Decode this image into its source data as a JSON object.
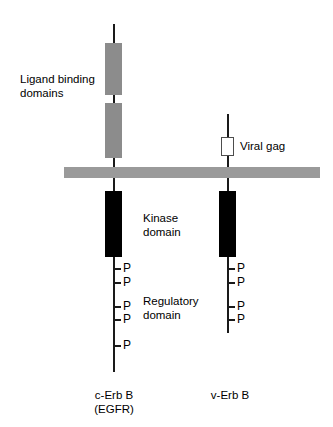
{
  "figure": {
    "type": "diagram",
    "membrane": {
      "name": "plasma-membrane",
      "color": "#9a9a9a"
    },
    "labels": {
      "ligand_binding": "Ligand binding\ndomains",
      "viral_gag": "Viral gag",
      "kinase": "Kinase\ndomain",
      "regulatory": "Regulatory\ndomain"
    },
    "proteins": [
      {
        "id": "c-erb-b",
        "name_line1": "c-Erb B",
        "name_line2": "(EGFR)",
        "axis_x": 114,
        "extracellular_boxes": [
          {
            "label": "ligand-binding-domain-1",
            "color": "#8c8c8c",
            "top": 43,
            "height": 52
          },
          {
            "label": "ligand-binding-domain-2",
            "color": "#8c8c8c",
            "top": 103,
            "height": 55
          }
        ],
        "kinase_box": {
          "label": "kinase-domain",
          "color": "#000000",
          "top": 191,
          "height": 66
        },
        "phosphorylation_sites": [
          {
            "label": "P",
            "y": 262
          },
          {
            "label": "P",
            "y": 276
          },
          {
            "label": "P",
            "y": 300
          },
          {
            "label": "P",
            "y": 313
          },
          {
            "label": "P",
            "y": 339
          }
        ],
        "phosphate_count": 5,
        "tail_end": 372
      },
      {
        "id": "v-erb-b",
        "name_line1": "v-Erb B",
        "name_line2": "",
        "axis_x": 228,
        "extracellular_boxes": [
          {
            "label": "viral-gag-domain",
            "color": "#ffffff",
            "top": 137,
            "height": 19
          }
        ],
        "kinase_box": {
          "label": "kinase-domain",
          "color": "#000000",
          "top": 191,
          "height": 66
        },
        "phosphorylation_sites": [
          {
            "label": "P",
            "y": 262
          },
          {
            "label": "P",
            "y": 276
          },
          {
            "label": "P",
            "y": 300
          },
          {
            "label": "P",
            "y": 313
          }
        ],
        "phosphate_count": 4,
        "tail_end": 333
      }
    ]
  }
}
